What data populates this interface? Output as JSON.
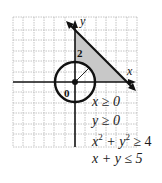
{
  "diagram": {
    "axis_labels": {
      "x": "x",
      "y": "y"
    },
    "tick_labels": {
      "origin": "0",
      "y_tick": "2"
    },
    "circle_radius": 2,
    "line": "x + y = 5",
    "region_fill": "#c8c8c8"
  },
  "inequalities": [
    {
      "html": "x ≥ 0"
    },
    {
      "html": "y ≥ 0"
    },
    {
      "html": "x² + y² ≥ 4"
    },
    {
      "html": "x + y ≤ 5"
    }
  ],
  "inequality_text": {
    "line1": "x ≥ 0",
    "line2": "y ≥ 0",
    "line3_a": "x",
    "line3_b": "2",
    "line3_c": " + y",
    "line3_d": "2",
    "line3_e": " ≥ 4",
    "line4": "x + y ≤ 5"
  }
}
